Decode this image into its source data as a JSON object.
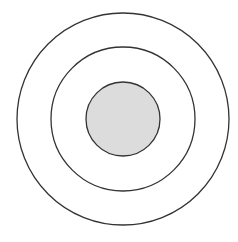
{
  "diagram": {
    "type": "concentric-circles",
    "center": [
      123,
      119
    ],
    "stroke_color": "#333333",
    "circles": [
      {
        "name": "outer-ring",
        "r": 106,
        "fill": "none"
      },
      {
        "name": "middle-ring",
        "r": 72,
        "fill": "none"
      },
      {
        "name": "inner-core",
        "r": 37,
        "fill": "#dcdcdc"
      }
    ]
  }
}
